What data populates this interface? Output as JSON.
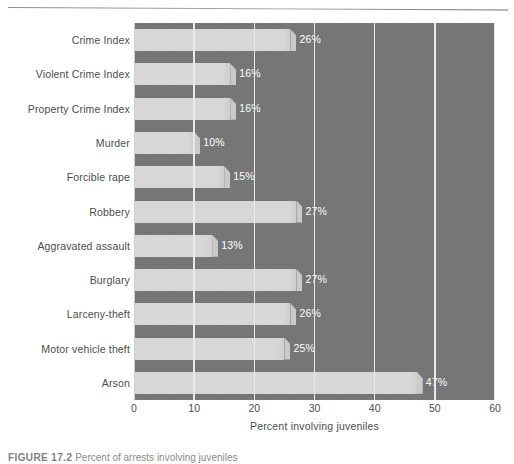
{
  "figure": {
    "caption_label": "FIGURE 17.2",
    "caption_text": "Percent of arrests involving juveniles"
  },
  "chart_data": {
    "type": "bar",
    "orientation": "horizontal",
    "title": "",
    "xlabel": "Percent involving juveniles",
    "ylabel": "",
    "xlim": [
      0,
      60
    ],
    "xticks": [
      0,
      10,
      20,
      30,
      40,
      50,
      60
    ],
    "xtick_labels": [
      "0",
      "10",
      "20",
      "30",
      "40",
      "50",
      "60"
    ],
    "grid": true,
    "grid_axis": "x",
    "legend": false,
    "categories": [
      "Crime Index",
      "Violent Crime Index",
      "Property Crime Index",
      "Murder",
      "Forcible rape",
      "Robbery",
      "Aggravated assault",
      "Burglary",
      "Larceny-theft",
      "Motor vehicle theft",
      "Arson"
    ],
    "values": [
      26,
      16,
      16,
      10,
      15,
      27,
      13,
      27,
      26,
      25,
      47
    ],
    "value_labels": [
      "26%",
      "16%",
      "16%",
      "10%",
      "15%",
      "27%",
      "13%",
      "27%",
      "26%",
      "25%",
      "47%"
    ],
    "colors": {
      "plot_background": "#767676",
      "bar_fill": "#d7d7d7",
      "gridline": "#e9e9e9",
      "value_label": "#ffffff",
      "axis_text": "#4c4c4c",
      "page_background": "#ffffff"
    }
  }
}
